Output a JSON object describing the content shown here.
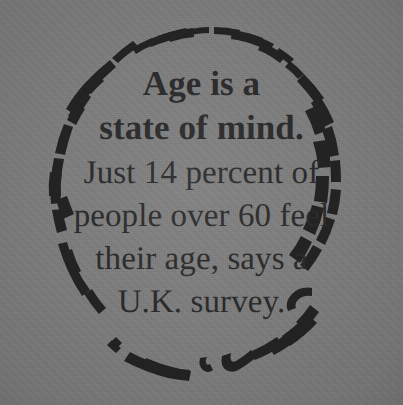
{
  "poster": {
    "background_color": "#7d7d7d",
    "ink_color": "#2b2b2b",
    "media": "printed-clipping-on-gray-paper"
  },
  "border": {
    "icon": "rough-hand-drawn-circle-icon",
    "style": "broken brush-stroke ring",
    "color": "#232323"
  },
  "quote": {
    "headline": {
      "line1": "Age is a",
      "line2": "state of mind."
    },
    "body": {
      "line1": "Just 14 percent of",
      "line2": "people over 60 feel",
      "line3": "their age, says a",
      "line4": "U.K. survey."
    },
    "full_text": "Age is a state of mind. Just 14 percent of people over 60 feel their age, says a U.K. survey.",
    "statistic_percent": "14",
    "age_threshold": "60",
    "source": "U.K. survey"
  }
}
